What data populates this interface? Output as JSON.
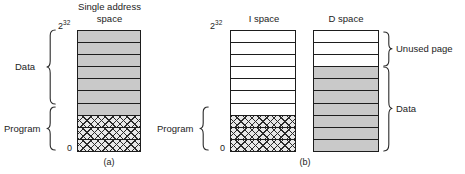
{
  "figure": {
    "panel_a": {
      "title_line1": "Single address",
      "title_line2": "space",
      "caption": "(a)",
      "top_address": "2",
      "top_address_exp": "32",
      "bottom_address": "0",
      "brace_labels": {
        "data": "Data",
        "program": "Program"
      },
      "bar": {
        "name": "single-address-space",
        "cells_top_to_bottom": [
          {
            "fill": "gray",
            "region": "Data"
          },
          {
            "fill": "gray",
            "region": "Data"
          },
          {
            "fill": "gray",
            "region": "Data"
          },
          {
            "fill": "gray",
            "region": "Data"
          },
          {
            "fill": "gray",
            "region": "Data"
          },
          {
            "fill": "gray",
            "region": "Data"
          },
          {
            "fill": "gray",
            "region": "Data"
          },
          {
            "fill": "hatch",
            "region": "Program"
          },
          {
            "fill": "hatch",
            "region": "Program"
          },
          {
            "fill": "hatch",
            "region": "Program"
          }
        ]
      }
    },
    "panel_b": {
      "caption": "(b)",
      "top_address": "2",
      "top_address_exp": "32",
      "bottom_address": "0",
      "brace_labels": {
        "program": "Program",
        "unused_page": "Unused page",
        "data": "Data"
      },
      "i_space": {
        "title": "I space",
        "cells_top_to_bottom": [
          {
            "fill": "white",
            "region": "unused"
          },
          {
            "fill": "white",
            "region": "unused"
          },
          {
            "fill": "white",
            "region": "unused"
          },
          {
            "fill": "white",
            "region": "unused"
          },
          {
            "fill": "white",
            "region": "unused"
          },
          {
            "fill": "white",
            "region": "unused"
          },
          {
            "fill": "white",
            "region": "unused"
          },
          {
            "fill": "hatch",
            "region": "Program"
          },
          {
            "fill": "hatch",
            "region": "Program"
          },
          {
            "fill": "hatch",
            "region": "Program"
          }
        ]
      },
      "d_space": {
        "title": "D space",
        "cells_top_to_bottom": [
          {
            "fill": "white",
            "region": "Unused page"
          },
          {
            "fill": "white",
            "region": "Unused page"
          },
          {
            "fill": "white",
            "region": "Unused page"
          },
          {
            "fill": "gray",
            "region": "Data"
          },
          {
            "fill": "gray",
            "region": "Data"
          },
          {
            "fill": "gray",
            "region": "Data"
          },
          {
            "fill": "gray",
            "region": "Data"
          },
          {
            "fill": "gray",
            "region": "Data"
          },
          {
            "fill": "gray",
            "region": "Data"
          },
          {
            "fill": "gray",
            "region": "Data"
          }
        ]
      }
    },
    "colors": {
      "data_fill": "#c9c9c9",
      "program_fill": "#e8e8e8",
      "unused_fill": "#ffffff",
      "stroke": "#1d1d1d",
      "text": "#232323"
    }
  }
}
